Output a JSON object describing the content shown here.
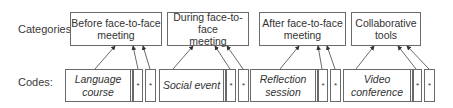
{
  "labels": {
    "categories": "Categories:",
    "codes": "Codes:"
  },
  "categories": [
    {
      "line1": "Before face-to-face",
      "line2": "meeting"
    },
    {
      "line1": "During face-to-face",
      "line2": "meeting"
    },
    {
      "line1": "After face-to-face",
      "line2": "meeting"
    },
    {
      "line1": "Collaborative",
      "line2": "tools"
    }
  ],
  "codes": [
    {
      "line1": "Language",
      "line2": "course",
      "extra": [
        "*",
        "*"
      ]
    },
    {
      "line1": "Social event",
      "line2": "",
      "extra": [
        "*",
        "*"
      ]
    },
    {
      "line1": "Reflection",
      "line2": "session",
      "extra": [
        "*",
        "*"
      ]
    },
    {
      "line1": "Video",
      "line2": "conference",
      "extra": [
        "*",
        "*"
      ]
    }
  ],
  "colors": {
    "stroke": "#6a6a6a",
    "text": "#333333",
    "background": "#ffffff"
  }
}
